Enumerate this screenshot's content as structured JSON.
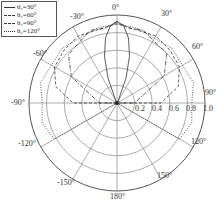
{
  "chart_data": {
    "type": "polar-line",
    "title": "",
    "angular_axis": {
      "direction": "clockwise",
      "zero_location": "top",
      "tick_labels": [
        "0°",
        "30°",
        "60°",
        "90°",
        "120°",
        "150°",
        "180°",
        "-150°",
        "-120°",
        "-90°",
        "-60°",
        "-30°"
      ],
      "tick_angles_deg": [
        0,
        30,
        60,
        90,
        120,
        150,
        180,
        -150,
        -120,
        -90,
        -60,
        -30
      ]
    },
    "radial_axis": {
      "range": [
        0,
        1.0
      ],
      "tick_labels": [
        "0.2",
        "0.4",
        "0.6",
        "0.8",
        "1.0"
      ],
      "ticks": [
        0.2,
        0.4,
        0.6,
        0.8,
        1.0
      ]
    },
    "grid": true,
    "legend_position": "upper-left",
    "series": [
      {
        "name": "θ0=30°",
        "style": "solid",
        "theta_deg": [
          -90,
          -60,
          -30,
          -20,
          -15,
          -10,
          -5,
          0,
          5,
          10,
          15,
          20,
          30,
          60,
          90
        ],
        "r": [
          0.0,
          0.0,
          0.02,
          0.3,
          0.55,
          0.75,
          0.88,
          0.93,
          0.88,
          0.75,
          0.55,
          0.3,
          0.02,
          0.0,
          0.0
        ]
      },
      {
        "name": "θ0=60°",
        "style": "dash-dot",
        "theta_deg": [
          -90,
          -60,
          -45,
          -30,
          -20,
          -10,
          0,
          10,
          20,
          30,
          45,
          60,
          90
        ],
        "r": [
          0.2,
          0.6,
          0.78,
          0.82,
          0.88,
          0.86,
          0.92,
          0.86,
          0.88,
          0.82,
          0.8,
          0.62,
          0.2
        ]
      },
      {
        "name": "θ0=90°",
        "style": "dashed",
        "theta_deg": [
          -90,
          -75,
          -60,
          -45,
          -30,
          -15,
          0,
          15,
          30,
          45,
          60,
          75,
          90
        ],
        "r": [
          0.5,
          0.72,
          0.82,
          0.85,
          0.88,
          0.86,
          0.9,
          0.86,
          0.88,
          0.85,
          0.82,
          0.72,
          0.5
        ]
      },
      {
        "name": "θ0=120°",
        "style": "dotted",
        "theta_deg": [
          -120,
          -105,
          -90,
          -75,
          -60,
          -45,
          -30,
          -15,
          0,
          15,
          30,
          45,
          60,
          75,
          90,
          105,
          120
        ],
        "r": [
          0.82,
          0.88,
          0.85,
          0.9,
          0.86,
          0.88,
          0.85,
          0.88,
          0.9,
          0.88,
          0.85,
          0.88,
          0.86,
          0.9,
          0.85,
          0.88,
          0.82
        ]
      }
    ]
  },
  "legend": {
    "items": [
      {
        "label": "θ₀=30°",
        "style": "solid"
      },
      {
        "label": "θ₀=60°",
        "style": "dash-dot"
      },
      {
        "label": "θ₀=90°",
        "style": "dashed"
      },
      {
        "label": "θ₀=120°",
        "style": "dotted"
      }
    ]
  },
  "labels": {
    "a0": "0°",
    "a30": "30°",
    "a60": "60°",
    "a90": "90°",
    "a120": "120°",
    "a150": "150°",
    "a180": "180°",
    "am150": "-150°",
    "am120": "-120°",
    "am90": "-90°",
    "am60": "-60°",
    "am30": "-30°",
    "r02": "0.2",
    "r04": "0.4",
    "r06": "0.6",
    "r08": "0.8",
    "r10": "1.0"
  },
  "colors": {
    "grid": "#888888",
    "line": "#333333",
    "background": "#ffffff"
  }
}
